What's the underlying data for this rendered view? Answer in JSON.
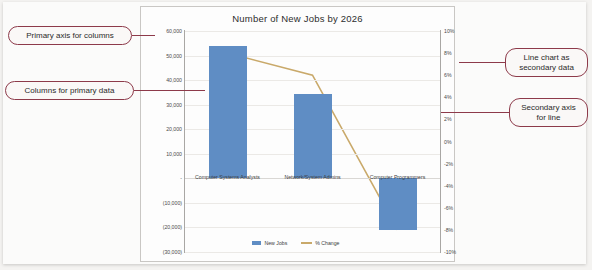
{
  "chart": {
    "title": "Number of New Jobs by 2026"
  },
  "legend": {
    "items": [
      {
        "label": "New Jobs",
        "marker": "square-swatch",
        "color": "#5f8dc4"
      },
      {
        "label": "% Change",
        "marker": "line-swatch",
        "color": "#c9a96a"
      }
    ]
  },
  "annotations": [
    {
      "id": "primary-axis",
      "text": "Primary axis for columns"
    },
    {
      "id": "columns",
      "text": "Columns for primary data"
    },
    {
      "id": "line-chart",
      "text": "Line chart as secondary data"
    },
    {
      "id": "secondary-axis",
      "text": "Secondary axis for line"
    }
  ],
  "chart_data": {
    "type": "bar",
    "title": "Number of New Jobs by 2026",
    "xlabel": "",
    "ylabel": "",
    "categories": [
      "Computer Systems Analysts",
      "Network/System Admins",
      "Computer Programmers"
    ],
    "series": [
      {
        "name": "New Jobs",
        "type": "bar",
        "axis": "primary",
        "color": "#5f8dc4",
        "values": [
          54000,
          34500,
          -21000
        ]
      },
      {
        "name": "% Change",
        "type": "line",
        "axis": "secondary",
        "color": "#c9a96a",
        "values": [
          0.08,
          0.06,
          -0.08
        ]
      }
    ],
    "primary_axis": {
      "ylim": [
        -30000,
        60000
      ],
      "ticks": [
        60000,
        50000,
        40000,
        30000,
        20000,
        10000,
        0,
        -10000,
        -20000,
        -30000
      ],
      "tick_labels": [
        "60,000",
        "50,000",
        "40,000",
        "30,000",
        "20,000",
        "10,000",
        "-",
        "(10,000)",
        "(20,000)",
        "(30,000)"
      ]
    },
    "secondary_axis": {
      "ylim": [
        -0.1,
        0.1
      ],
      "ticks": [
        0.1,
        0.08,
        0.06,
        0.04,
        0.02,
        0,
        -0.02,
        -0.04,
        -0.06,
        -0.08,
        -0.1
      ],
      "tick_labels": [
        "10%",
        "8%",
        "6%",
        "4%",
        "2%",
        "0%",
        "-2%",
        "-4%",
        "-6%",
        "-8%",
        "-10%"
      ]
    },
    "grid": true,
    "legend_position": "bottom"
  }
}
